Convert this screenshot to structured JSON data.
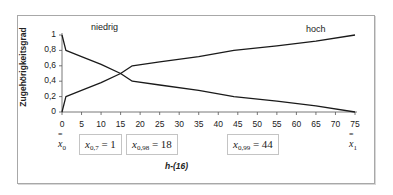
{
  "chart_data": {
    "type": "line",
    "title": "",
    "xlabel": "h-(16)",
    "ylabel": "Zugehörigkeitsgrad",
    "xlim": [
      0,
      75
    ],
    "ylim": [
      0,
      1
    ],
    "x_ticks": [
      "0",
      "5",
      "10",
      "15",
      "20",
      "25",
      "30",
      "35",
      "40",
      "45",
      "50",
      "55",
      "60",
      "65",
      "70",
      "75"
    ],
    "y_ticks": [
      "0",
      "0,2",
      "0,4",
      "0,6",
      "0,8",
      "1"
    ],
    "grid": false,
    "legend_position": "inline",
    "series": [
      {
        "name": "niedrig",
        "x": [
          0,
          1,
          5,
          10,
          15,
          18,
          25,
          35,
          44,
          55,
          65,
          75
        ],
        "values": [
          1.0,
          0.8,
          0.72,
          0.62,
          0.5,
          0.4,
          0.35,
          0.28,
          0.2,
          0.14,
          0.08,
          0.0
        ]
      },
      {
        "name": "hoch",
        "x": [
          0,
          1,
          5,
          10,
          15,
          18,
          25,
          35,
          44,
          55,
          65,
          75
        ],
        "values": [
          0.0,
          0.2,
          0.28,
          0.38,
          0.5,
          0.6,
          0.65,
          0.72,
          0.8,
          0.86,
          0.92,
          1.0
        ]
      }
    ],
    "annotations": [
      {
        "text": "x̄0",
        "position": "x=0"
      },
      {
        "text": "x0,7 = 1"
      },
      {
        "text": "x0,98 = 18"
      },
      {
        "text": "x0,99 = 44"
      },
      {
        "text": "x̄1",
        "position": "x=75"
      }
    ]
  },
  "labels": {
    "ylabel": "Zugehörigkeitsgrad",
    "xlabel": "h-(16)",
    "series_low": "niedrig",
    "series_high": "hoch"
  },
  "annotations": {
    "xbar0_main": "x",
    "xbar0_sub": "0",
    "a1_var": "x",
    "a1_sub": "0,7",
    "a1_eq": " = 1",
    "a2_var": "x",
    "a2_sub": "0,98",
    "a2_eq": " = 18",
    "a3_var": "x",
    "a3_sub": "0,99",
    "a3_eq": " = 44",
    "xbar1_main": "x",
    "xbar1_sub": "1",
    "bar_glyph": "="
  },
  "colors": {
    "line": "#1a1a1a",
    "frame": "#a8a8a8",
    "text": "#222222"
  }
}
